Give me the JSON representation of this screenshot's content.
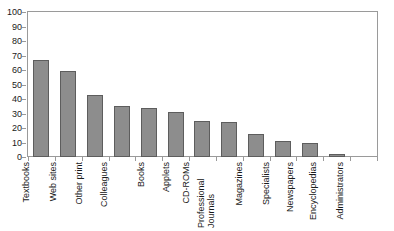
{
  "chart_data": {
    "type": "bar",
    "title": "",
    "subtitle": "",
    "xlabel": "",
    "ylabel": "",
    "ylim": [
      0,
      100
    ],
    "ytick_step": 10,
    "yticks": [
      100,
      90,
      80,
      70,
      60,
      50,
      40,
      30,
      20,
      10,
      0
    ],
    "grid": false,
    "legend": false,
    "legend_position": "none",
    "orientation": "vertical",
    "xtick_label_rotation": -90,
    "categories": [
      "Textbooks",
      "Web sites",
      "Other print",
      "Colleagues",
      "Books",
      "Applets",
      "CD-ROMs",
      "Professional Journals",
      "Magazines",
      "Specialists",
      "Newspapers",
      "Encyclopedias",
      "Administrators"
    ],
    "values": [
      67,
      59,
      43,
      35,
      34,
      31,
      25,
      24,
      16,
      11,
      10,
      2,
      0
    ],
    "colors": {
      "bar_fill": "#8d8d8d",
      "bar_outline": "#5d5d5d",
      "axis": "#9a9a9a",
      "text": "#1a1a1a",
      "background": "#ffffff"
    }
  },
  "artifact": {
    "top_strip_text": "."
  }
}
